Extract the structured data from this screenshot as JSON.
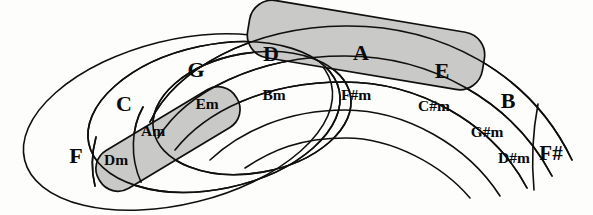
{
  "diagram": {
    "type": "nested-region-venn",
    "colors": {
      "ink": "#100f0d",
      "shade_fill": "#c9c9c7",
      "background": "#fdfdfb"
    },
    "major_keys": [
      {
        "id": "F",
        "label": "F",
        "x": 76,
        "y": 158,
        "size": "major"
      },
      {
        "id": "C",
        "label": "C",
        "x": 124,
        "y": 106,
        "size": "major"
      },
      {
        "id": "G",
        "label": "G",
        "x": 196,
        "y": 72,
        "size": "major"
      },
      {
        "id": "D",
        "label": "D",
        "x": 271,
        "y": 56,
        "size": "major"
      },
      {
        "id": "A",
        "label": "A",
        "x": 361,
        "y": 55,
        "size": "major"
      },
      {
        "id": "E",
        "label": "E",
        "x": 442,
        "y": 73,
        "size": "major"
      },
      {
        "id": "B",
        "label": "B",
        "x": 508,
        "y": 103,
        "size": "major"
      },
      {
        "id": "Fs",
        "label": "F#",
        "x": 551,
        "y": 155,
        "size": "major"
      }
    ],
    "minor_keys": [
      {
        "id": "Dm",
        "label": "Dm",
        "x": 116,
        "y": 161,
        "size": "minor"
      },
      {
        "id": "Am",
        "label": "Am",
        "x": 153,
        "y": 132,
        "size": "minor"
      },
      {
        "id": "Em",
        "label": "Em",
        "x": 207,
        "y": 105,
        "size": "minor"
      },
      {
        "id": "Bm",
        "label": "Bm",
        "x": 274,
        "y": 96,
        "size": "minor"
      },
      {
        "id": "Fsm",
        "label": "F#m",
        "x": 356,
        "y": 96,
        "size": "minor"
      },
      {
        "id": "Csm",
        "label": "C#m",
        "x": 434,
        "y": 107,
        "size": "minor"
      },
      {
        "id": "Gsm",
        "label": "G#m",
        "x": 487,
        "y": 133,
        "size": "minor"
      },
      {
        "id": "Dsm",
        "label": "D#m",
        "x": 514,
        "y": 159,
        "size": "minor"
      }
    ],
    "shaded_regions": [
      {
        "id": "upper-highlight",
        "note": "D A E band"
      },
      {
        "id": "lower-highlight",
        "note": "Dm Am Em band"
      }
    ]
  }
}
